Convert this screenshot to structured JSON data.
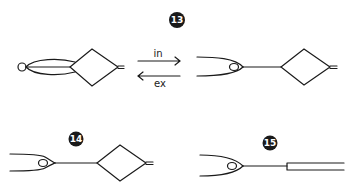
{
  "figure": {
    "type": "knot-tying-steps-diagram",
    "colors": {
      "ink": "#1a1a1a",
      "background": "#ffffff",
      "badge_text": "#ffffff"
    },
    "steps": [
      {
        "id": "step-13",
        "badge": "13"
      },
      {
        "id": "step-14",
        "badge": "14"
      },
      {
        "id": "step-15",
        "badge": "15"
      }
    ],
    "arrows": [
      {
        "id": "arrow-in",
        "label": "in",
        "direction": "right"
      },
      {
        "id": "arrow-ex",
        "label": "ex",
        "direction": "left"
      }
    ]
  }
}
